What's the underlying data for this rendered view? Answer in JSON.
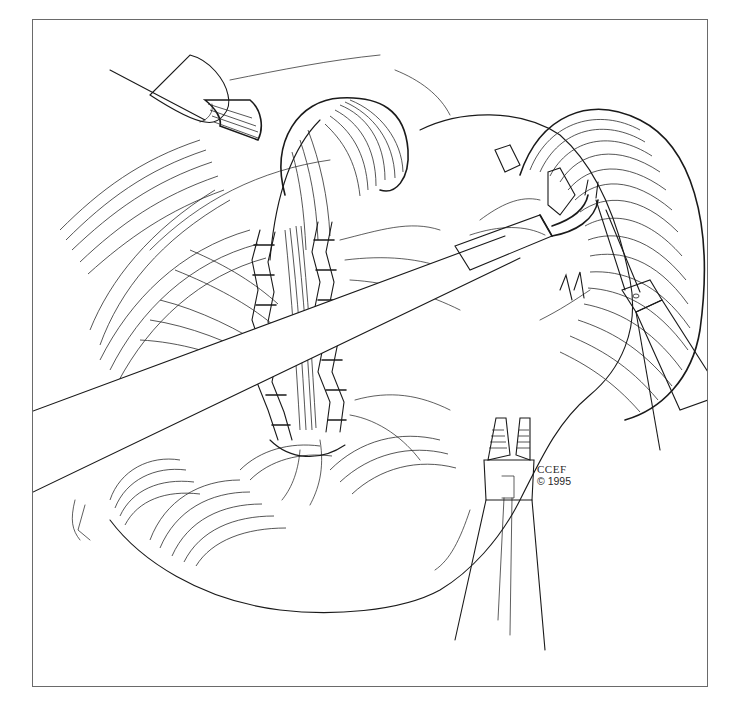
{
  "illustration": {
    "subject": "surgical line drawing: laparoscopic instruments over organ with stapled tissue",
    "style": "black ink line art on white with bordered frame",
    "colors": {
      "ink": "#1a1a1a",
      "background": "#ffffff",
      "frame": "#6a6a6a"
    }
  },
  "credit": {
    "line1": "CCEF",
    "line2": "© 1995"
  },
  "elements": [
    {
      "name": "grasper-top-left",
      "kind": "instrument"
    },
    {
      "name": "long-shaft-instrument",
      "kind": "instrument"
    },
    {
      "name": "grasper-right",
      "kind": "instrument"
    },
    {
      "name": "clip-applier-bottom",
      "kind": "instrument"
    },
    {
      "name": "staple-line",
      "kind": "tissue-detail"
    },
    {
      "name": "organ",
      "kind": "anatomy"
    }
  ]
}
